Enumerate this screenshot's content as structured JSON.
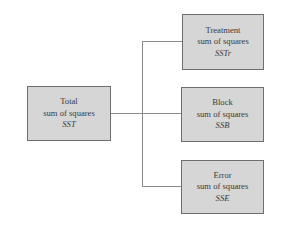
{
  "diagram": {
    "root": {
      "title": "Total",
      "subtitle": "sum of squares",
      "symbol": "SST"
    },
    "children": [
      {
        "title": "Treatment",
        "subtitle": "sum of squares",
        "symbol": "SSTr"
      },
      {
        "title": "Block",
        "subtitle": "sum of squares",
        "symbol": "SSB"
      },
      {
        "title": "Error",
        "subtitle": "sum of squares",
        "symbol": "SSE"
      }
    ],
    "colors": {
      "box_fill": "#d6d6d6",
      "box_border": "#6e6e6e",
      "connector": "#8a8a8a",
      "text": "#3a3a3a"
    }
  }
}
